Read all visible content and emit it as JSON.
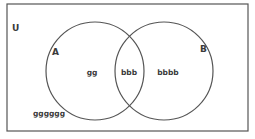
{
  "diagram": {
    "type": "venn",
    "universe": {
      "label": "U",
      "x": 7,
      "y": 4,
      "width": 241,
      "height": 127
    },
    "stroke_color": "#555555",
    "sets": [
      {
        "label": "A",
        "cx": 95,
        "cy": 71,
        "r": 49,
        "label_x": 55,
        "label_y": 55
      },
      {
        "label": "B",
        "cx": 164,
        "cy": 71,
        "r": 49,
        "label_x": 203,
        "label_y": 52
      }
    ],
    "regions": {
      "a_only": {
        "text": "gg",
        "x": 92,
        "y": 75
      },
      "intersection": {
        "text": "bbb",
        "x": 129,
        "y": 75
      },
      "b_only": {
        "text": "bbbb",
        "x": 168,
        "y": 75
      },
      "outside": {
        "text": "gggggg",
        "x": 49,
        "y": 116
      }
    }
  }
}
